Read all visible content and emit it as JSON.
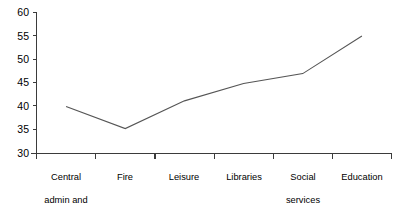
{
  "chart_data": {
    "type": "line",
    "title": "",
    "subtitle": "",
    "xlabel": "",
    "ylabel": "",
    "categories": [
      "Central admin and offices",
      "Fire",
      "Leisure",
      "Libraries",
      "Social services",
      "Education"
    ],
    "category_lines": [
      [
        "Central",
        "admin and",
        "offices"
      ],
      [
        "Fire"
      ],
      [
        "Leisure"
      ],
      [
        "Libraries"
      ],
      [
        "Social",
        "services"
      ],
      [
        "Education"
      ]
    ],
    "values": [
      40,
      35.3,
      41.2,
      44.9,
      47,
      55
    ],
    "ylim": [
      30,
      60
    ],
    "yticks": [
      30,
      35,
      40,
      45,
      50,
      55,
      60
    ],
    "ytick_labels": [
      "30",
      "35",
      "40",
      "45",
      "50",
      "55",
      "60"
    ],
    "grid": false,
    "legend": false,
    "legend_position": "none",
    "series": [
      {
        "name": "",
        "values": [
          40,
          35.3,
          41.2,
          44.9,
          47,
          55
        ],
        "color": "#555555"
      }
    ],
    "axis_color": "#3b3b3b",
    "line_color": "#555555",
    "background": "#ffffff"
  },
  "axis": {
    "y_label_0": "30",
    "y_label_1": "35",
    "y_label_2": "40",
    "y_label_3": "45",
    "y_label_4": "50",
    "y_label_5": "55",
    "y_label_6": "60"
  },
  "xlabels": {
    "cat0_line0": "Central",
    "cat0_line1": "admin and",
    "cat0_line2": "offices",
    "cat1_line0": "Fire",
    "cat2_line0": "Leisure",
    "cat3_line0": "Libraries",
    "cat4_line0": "Social",
    "cat4_line1": "services",
    "cat5_line0": "Education"
  }
}
